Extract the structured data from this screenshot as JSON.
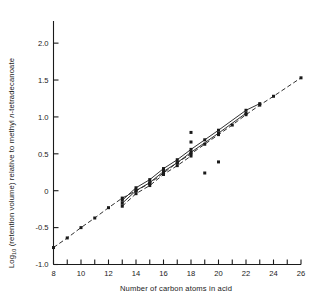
{
  "figure": {
    "width": 318,
    "height": 305,
    "background": "#ffffff",
    "ink_color": "#1a1a1a"
  },
  "chart_data": {
    "type": "scatter",
    "title": "",
    "xlabel": "Number of carbon atoms in acid",
    "ylabel_parts": {
      "pre": "Log",
      "sub": "10",
      "mid": " (retention volume) relative to methyl ",
      "italic": "n",
      "post": "-tetradecanoate"
    },
    "ylabel": "Log10 (retention volume) relative to methyl n-tetradecanoate",
    "xlim": [
      8,
      26
    ],
    "ylim": [
      -1.0,
      2.3
    ],
    "xticks": [
      8,
      9,
      10,
      11,
      12,
      13,
      14,
      15,
      16,
      17,
      18,
      19,
      20,
      21,
      22,
      23,
      24,
      25,
      26
    ],
    "xtick_labels": [
      "8",
      "",
      "10",
      "",
      "12",
      "",
      "14",
      "",
      "16",
      "",
      "18",
      "",
      "20",
      "",
      "22",
      "",
      "24",
      "",
      "26"
    ],
    "yticks": [
      -1.0,
      -0.5,
      0,
      0.5,
      1.0,
      1.5,
      2.0
    ],
    "ytick_labels": [
      "-1.0",
      "-0.5",
      "0",
      "0.5",
      "1.0",
      "1.5",
      "2.0"
    ],
    "grid": false,
    "legend": "none",
    "marker": "filled-square",
    "marker_size_px": 3.0,
    "series": [
      {
        "name": "saturated-straight-chain-homologous-series",
        "style": "dashed-line-with-squares",
        "x": [
          8,
          9,
          10,
          11,
          12,
          13,
          14,
          15,
          16,
          17,
          18,
          19,
          20,
          21,
          22,
          23,
          24,
          26
        ],
        "y": [
          -0.77,
          -0.64,
          -0.5,
          -0.37,
          -0.23,
          -0.1,
          0.0,
          0.1,
          0.24,
          0.38,
          0.5,
          0.63,
          0.76,
          0.89,
          1.03,
          1.16,
          1.28,
          1.53
        ]
      },
      {
        "name": "branched-series-upper-line-a",
        "style": "solid-line-with-squares",
        "x": [
          13,
          14,
          15,
          16,
          17,
          18,
          19,
          20,
          22,
          23
        ],
        "y": [
          -0.13,
          0.04,
          0.15,
          0.3,
          0.42,
          0.56,
          0.69,
          0.82,
          1.09,
          1.18
        ]
      },
      {
        "name": "branched-series-middle-line-b",
        "style": "solid-line-with-squares",
        "x": [
          13,
          14,
          15,
          16,
          17,
          18,
          20,
          22
        ],
        "y": [
          -0.17,
          0.0,
          0.11,
          0.26,
          0.38,
          0.52,
          0.78,
          1.05
        ]
      },
      {
        "name": "branched-series-lower-line-c",
        "style": "dashed-line-with-squares",
        "x": [
          13,
          14,
          15,
          16,
          17,
          18
        ],
        "y": [
          -0.21,
          -0.04,
          0.07,
          0.22,
          0.34,
          0.47
        ]
      }
    ],
    "outliers": {
      "name": "unresolved-points",
      "style": "isolated-squares",
      "x": [
        18,
        18,
        19,
        20
      ],
      "y": [
        0.79,
        0.66,
        0.24,
        0.39
      ]
    }
  }
}
